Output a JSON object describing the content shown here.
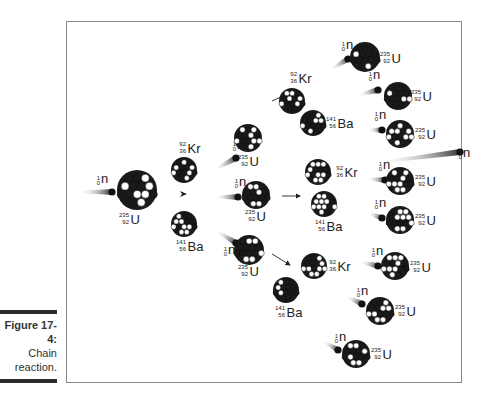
{
  "caption": {
    "figure_label": "Figure 17-4:",
    "text_line1": "Chain",
    "text_line2": "reaction."
  },
  "diagram": {
    "title": "Chain reaction",
    "particles": {
      "neutron": {
        "symbol": "n",
        "mass": "1",
        "atomic": "0"
      },
      "uranium": {
        "symbol": "U",
        "mass": "235",
        "atomic": "92"
      },
      "krypton": {
        "symbol": "Kr",
        "mass": "92",
        "atomic": "36"
      },
      "barium": {
        "symbol": "Ba",
        "mass": "141",
        "atomic": "56"
      }
    },
    "generations": [
      {
        "stage": "initial",
        "nuclei": [
          "U-235"
        ],
        "incoming": "neutron"
      },
      {
        "stage": "fission-1",
        "products": [
          "Kr-92",
          "Ba-141"
        ],
        "neutrons_released": 3,
        "next_targets": [
          "U-235",
          "U-235",
          "U-235"
        ]
      },
      {
        "stage": "fission-2",
        "products": [
          [
            "Kr-92",
            "Ba-141"
          ],
          [
            "Kr-92",
            "Ba-141"
          ],
          [
            "Kr-92",
            "Ba-141"
          ]
        ],
        "neutrons_released": 9,
        "next_targets": [
          "U-235",
          "U-235",
          "U-235",
          "U-235",
          "U-235",
          "U-235",
          "U-235",
          "U-235"
        ]
      }
    ],
    "colors": {
      "nucleon_dark": "#1a1a1a",
      "nucleon_light": "#ffffff",
      "frame": "#8a8a8a",
      "text": "#222222"
    }
  }
}
